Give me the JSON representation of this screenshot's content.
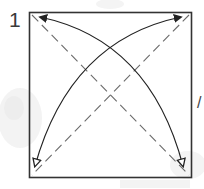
{
  "diagram": {
    "type": "origami-step",
    "step_number": "1",
    "edge_mark": "/",
    "colors": {
      "paper_edge": "#333333",
      "fold_line": "#6a6a6a",
      "arrow": "#222222",
      "watermark": "#f0f0f0",
      "background": "#ffffff"
    },
    "square": {
      "x": 29,
      "y": 12,
      "width": 162,
      "height": 165
    },
    "creases": [
      {
        "kind": "valley-fold-dashed",
        "from": "top-left",
        "to": "bottom-right"
      },
      {
        "kind": "valley-fold-dashed",
        "from": "top-right",
        "to": "bottom-left"
      }
    ],
    "arrows": [
      {
        "kind": "fold-and-unfold",
        "from": "bottom-right",
        "to": "top-left",
        "head_start": "hollow",
        "head_end": "filled"
      },
      {
        "kind": "fold-and-unfold",
        "from": "bottom-left",
        "to": "top-right",
        "head_start": "hollow",
        "head_end": "filled"
      }
    ]
  }
}
